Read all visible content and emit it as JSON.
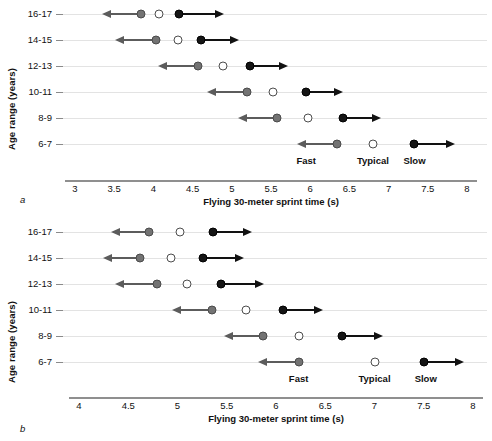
{
  "figure": {
    "panel_a_letter": "a",
    "panel_b_letter": "b",
    "ylabel": "Age range (years)",
    "xlabel": "Flying 30-meter sprint time (s)",
    "category_labels": {
      "fast": "Fast",
      "typical": "Typical",
      "slow": "Slow"
    },
    "colors": {
      "fast": "#737373",
      "typical": "#ffffff",
      "slow": "#151515",
      "grid": "#e3e3e3",
      "axis": "#8f8f8f"
    }
  },
  "chart_data": [
    {
      "type": "scatter",
      "panel": "a",
      "title": "",
      "xlabel": "Flying 30-meter sprint time (s)",
      "ylabel": "Age range (years)",
      "xlim": [
        3,
        8
      ],
      "xticks": [
        3,
        3.5,
        4,
        4.5,
        5,
        5.5,
        6,
        6.5,
        7,
        7.5,
        8
      ],
      "xticklabels": [
        "3",
        "3.5",
        "4",
        "4.5",
        "5",
        "5.5",
        "6",
        "6.5",
        "7",
        "7.5",
        "8"
      ],
      "categories": [
        "16-17",
        "14-15",
        "12-13",
        "10-11",
        "8-9",
        "6-7"
      ],
      "grid": true,
      "legend": [
        "Fast",
        "Typical",
        "Slow"
      ],
      "legend_position": "bottom-inline",
      "legend_x": [
        5.95,
        6.8,
        7.33
      ],
      "series": [
        {
          "name": "Fast",
          "values": [
            3.84,
            4.03,
            4.57,
            5.19,
            5.58,
            6.34
          ]
        },
        {
          "name": "Typical",
          "values": [
            4.07,
            4.31,
            4.89,
            5.53,
            5.97,
            6.8
          ]
        },
        {
          "name": "Slow",
          "values": [
            4.33,
            4.61,
            5.23,
            5.95,
            6.42,
            7.32
          ]
        }
      ],
      "arrows": [
        {
          "category": "16-17",
          "left_from": 3.84,
          "left_to": 3.36,
          "right_from": 4.33,
          "right_to": 4.89
        },
        {
          "category": "14-15",
          "left_from": 4.03,
          "left_to": 3.52,
          "right_from": 4.61,
          "right_to": 5.08
        },
        {
          "category": "12-13",
          "left_from": 4.57,
          "left_to": 4.07,
          "right_from": 5.23,
          "right_to": 5.7
        },
        {
          "category": "10-11",
          "left_from": 5.19,
          "left_to": 4.7,
          "right_from": 5.95,
          "right_to": 6.41
        },
        {
          "category": "8-9",
          "left_from": 5.58,
          "left_to": 5.09,
          "right_from": 6.42,
          "right_to": 6.89
        },
        {
          "category": "6-7",
          "left_from": 6.34,
          "left_to": 5.84,
          "right_from": 7.32,
          "right_to": 7.84
        }
      ]
    },
    {
      "type": "scatter",
      "panel": "b",
      "title": "",
      "xlabel": "Flying 30-meter sprint time (s)",
      "ylabel": "Age range (years)",
      "xlim": [
        4,
        8
      ],
      "xticks": [
        4,
        4.5,
        5,
        5.5,
        6,
        6.5,
        7,
        7.5,
        8
      ],
      "xticklabels": [
        "4",
        "4.5",
        "5",
        "5.5",
        "6",
        "6.5",
        "7",
        "7.5",
        "8"
      ],
      "categories": [
        "16-17",
        "14-15",
        "12-13",
        "10-11",
        "8-9",
        "6-7"
      ],
      "grid": true,
      "legend": [
        "Fast",
        "Typical",
        "Slow"
      ],
      "legend_position": "bottom-inline",
      "legend_x": [
        6.23,
        7.0,
        7.52
      ],
      "series": [
        {
          "name": "Fast",
          "values": [
            4.71,
            4.62,
            4.79,
            5.35,
            5.87,
            6.23
          ]
        },
        {
          "name": "Typical",
          "values": [
            5.03,
            4.93,
            5.1,
            5.7,
            6.23,
            7.0
          ]
        },
        {
          "name": "Slow",
          "values": [
            5.36,
            5.26,
            5.44,
            6.07,
            6.67,
            7.5
          ]
        }
      ],
      "arrows": [
        {
          "category": "16-17",
          "left_from": 4.71,
          "left_to": 4.33,
          "right_from": 5.36,
          "right_to": 5.75
        },
        {
          "category": "14-15",
          "left_from": 4.62,
          "left_to": 4.25,
          "right_from": 5.26,
          "right_to": 5.66
        },
        {
          "category": "12-13",
          "left_from": 4.79,
          "left_to": 4.38,
          "right_from": 5.44,
          "right_to": 5.87
        },
        {
          "category": "10-11",
          "left_from": 5.35,
          "left_to": 4.95,
          "right_from": 6.07,
          "right_to": 6.47
        },
        {
          "category": "8-9",
          "left_from": 5.87,
          "left_to": 5.48,
          "right_from": 6.67,
          "right_to": 7.08
        },
        {
          "category": "6-7",
          "left_from": 6.23,
          "left_to": 5.83,
          "right_from": 7.5,
          "right_to": 7.9
        }
      ]
    }
  ]
}
